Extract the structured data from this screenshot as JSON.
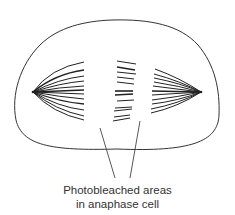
{
  "diagram": {
    "caption_line1": "Photobleached areas",
    "caption_line2": "in anaphase cell",
    "stroke_color": "#333333",
    "elements": [
      "cell-outline",
      "left-spindle-pole",
      "right-spindle-pole",
      "left-half-spindle-fibers",
      "middle-fiber-fragments",
      "right-half-spindle-fibers",
      "pointer-lines"
    ]
  }
}
